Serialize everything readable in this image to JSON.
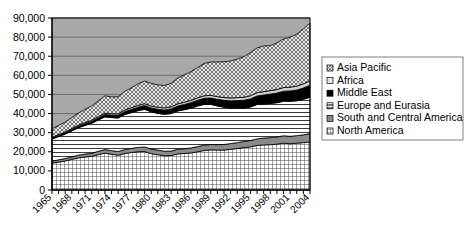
{
  "chart_data": {
    "type": "area",
    "title": "",
    "subtitle": "",
    "xlabel": "",
    "ylabel": "",
    "stacked": true,
    "grid": true,
    "legend_position": "right",
    "xlim": [
      1965,
      2004
    ],
    "ylim": [
      0,
      90000
    ],
    "ytick_labels": [
      "90,000",
      "80,000",
      "70,000",
      "60,000",
      "50,000",
      "40,000",
      "30,000",
      "20,000",
      "10,000",
      "0"
    ],
    "ytick_values": [
      90000,
      80000,
      70000,
      60000,
      50000,
      40000,
      30000,
      20000,
      10000,
      0
    ],
    "xtick_labels": [
      "1965",
      "1968",
      "1971",
      "1974",
      "1977",
      "1980",
      "1983",
      "1986",
      "1989",
      "1992",
      "1995",
      "1998",
      "2001",
      "2004"
    ],
    "xtick_values": [
      1965,
      1968,
      1971,
      1974,
      1977,
      1980,
      1983,
      1986,
      1989,
      1992,
      1995,
      1998,
      2001,
      2004
    ],
    "x": [
      1965,
      1966,
      1967,
      1968,
      1969,
      1970,
      1971,
      1972,
      1973,
      1974,
      1975,
      1976,
      1977,
      1978,
      1979,
      1980,
      1981,
      1982,
      1983,
      1984,
      1985,
      1986,
      1987,
      1988,
      1989,
      1990,
      1991,
      1992,
      1993,
      1994,
      1995,
      1996,
      1997,
      1998,
      1999,
      2000,
      2001,
      2002,
      2003,
      2004
    ],
    "series": [
      {
        "name": "North America",
        "pattern": "fine-grid",
        "values": [
          14000,
          14600,
          15200,
          16000,
          16800,
          17300,
          17600,
          18500,
          19300,
          18700,
          18200,
          19100,
          19600,
          20000,
          20100,
          19000,
          18500,
          17900,
          18000,
          18900,
          19100,
          19400,
          20000,
          20700,
          21000,
          20900,
          20900,
          21300,
          21700,
          22200,
          22600,
          23300,
          23600,
          23700,
          24000,
          24500,
          24200,
          24500,
          24800,
          25200
        ]
      },
      {
        "name": "South and Central America",
        "pattern": "solid-gray",
        "values": [
          1100,
          1180,
          1250,
          1330,
          1420,
          1500,
          1600,
          1720,
          1850,
          1900,
          1950,
          2080,
          2180,
          2300,
          2400,
          2400,
          2380,
          2400,
          2380,
          2450,
          2500,
          2600,
          2700,
          2780,
          2820,
          2850,
          2900,
          3000,
          3080,
          3180,
          3300,
          3450,
          3600,
          3700,
          3750,
          3850,
          3900,
          3950,
          4050,
          4300
        ]
      },
      {
        "name": "Europe and Eurasia",
        "pattern": "horizontal-lines",
        "values": [
          11500,
          12200,
          12800,
          13600,
          14400,
          15000,
          15700,
          16400,
          17100,
          17300,
          17500,
          18300,
          18700,
          19200,
          19700,
          19500,
          19200,
          19300,
          19600,
          20000,
          20400,
          20800,
          21200,
          21300,
          21000,
          20200,
          19500,
          18500,
          18000,
          17400,
          17500,
          18000,
          17800,
          17900,
          17900,
          18100,
          18300,
          18200,
          18600,
          19000
        ]
      },
      {
        "name": "Middle East",
        "pattern": "black",
        "values": [
          550,
          600,
          650,
          720,
          800,
          880,
          980,
          1080,
          1200,
          1300,
          1400,
          1550,
          1700,
          1850,
          2000,
          2050,
          2150,
          2300,
          2450,
          2600,
          2750,
          2900,
          3050,
          3200,
          3350,
          3500,
          3650,
          3850,
          4000,
          4150,
          4300,
          4500,
          4700,
          4900,
          5050,
          5250,
          5450,
          5650,
          5950,
          6300
        ]
      },
      {
        "name": "Africa",
        "pattern": "light-gray-thin",
        "values": [
          400,
          430,
          460,
          500,
          540,
          580,
          620,
          670,
          720,
          750,
          790,
          840,
          890,
          940,
          980,
          1000,
          1030,
          1060,
          1090,
          1130,
          1170,
          1220,
          1270,
          1320,
          1360,
          1400,
          1450,
          1500,
          1540,
          1580,
          1630,
          1690,
          1750,
          1800,
          1850,
          1920,
          1980,
          2040,
          2150,
          2300
        ]
      },
      {
        "name": "Asia Pacific",
        "pattern": "diagonal-crosshatch",
        "values": [
          4450,
          4790,
          5140,
          5750,
          6340,
          6940,
          7500,
          8230,
          9130,
          8750,
          8960,
          9730,
          10430,
          11210,
          11820,
          11850,
          11740,
          11740,
          12280,
          13420,
          14280,
          14980,
          15780,
          16900,
          17470,
          18150,
          18700,
          19350,
          20200,
          21190,
          22570,
          23410,
          23950,
          23500,
          24450,
          25380,
          26170,
          27210,
          28750,
          30200
        ]
      }
    ],
    "legend_order": [
      "Asia Pacific",
      "Africa",
      "Middle East",
      "Europe and Eurasia",
      "South and Central America",
      "North America"
    ],
    "colors": {
      "plot_background": "#a8a8a8",
      "gridline": "#6e6e6e",
      "axis": "#000000",
      "middle_east": "#000000",
      "south_central_america": "#8a8a8a",
      "africa": "#d0d0d0",
      "legend_border": "#808080"
    }
  }
}
